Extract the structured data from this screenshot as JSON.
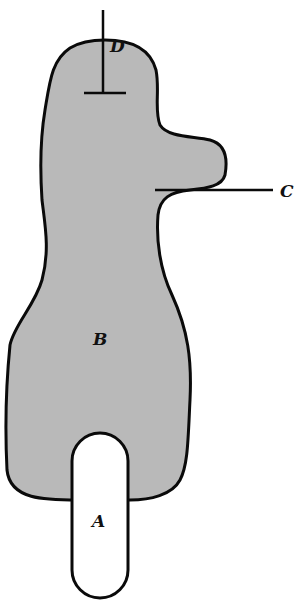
{
  "diagram": {
    "labels": {
      "A": "A",
      "B": "B",
      "C": "C",
      "D": "D"
    },
    "colors": {
      "fill": "#b9b9b9",
      "stroke": "#0a0a0a",
      "hole": "#ffffff"
    }
  }
}
